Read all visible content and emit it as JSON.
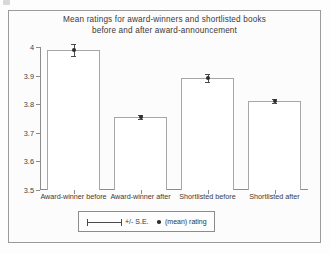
{
  "chart_data": {
    "type": "bar",
    "title": "Mean ratings for award-winners and shortlisted books before and after award-announcement",
    "title_line1": "Mean ratings for award-winners and shortlisted books",
    "title_line2": "before and after award-announcement",
    "xlabel": "",
    "ylabel": "",
    "ylim": [
      3.5,
      4.0
    ],
    "ytick_labels": [
      "4",
      "3.9",
      "3.8",
      "3.7",
      "3.6",
      "3.5"
    ],
    "ytick_values": [
      4.0,
      3.9,
      3.8,
      3.7,
      3.6,
      3.5
    ],
    "grid": false,
    "legend_position": "bottom-center",
    "categories": [
      "Award-winner before",
      "Award-winner after",
      "Shortlisted before",
      "Shortlisted after"
    ],
    "values": [
      3.99,
      3.755,
      3.89,
      3.81
    ],
    "errors": [
      0.022,
      0.008,
      0.014,
      0.007
    ],
    "series": [
      {
        "name": "(mean) rating",
        "values": [
          3.99,
          3.755,
          3.89,
          3.81
        ]
      }
    ],
    "legend": [
      {
        "label": "+/- S.E.",
        "marker": "error-bar"
      },
      {
        "label": "(mean) rating",
        "marker": "dot"
      }
    ],
    "colors": {
      "bar_fill": "#ffffff",
      "bar_outline": "#a6a6a6",
      "marker": "#2e2e2e",
      "axis": "#8c8c8c",
      "text": "#3a3a3a"
    }
  }
}
